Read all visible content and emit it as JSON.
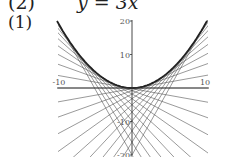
{
  "heading": {
    "number": "(2)",
    "equation": "y = 3x"
  },
  "subpart": "(1)",
  "chart_data": {
    "type": "line",
    "title": "",
    "xlabel": "",
    "ylabel": "",
    "xlim": [
      -10,
      10
    ],
    "ylim": [
      -20,
      20
    ],
    "x_ticks": [
      "-10",
      "10"
    ],
    "y_ticks": [
      "20",
      "10",
      "-10",
      "-20"
    ],
    "grid": false,
    "series": [
      {
        "name": "envelope",
        "function": "y = x^2/5",
        "x": [
          -10,
          -8,
          -6,
          -4,
          -2,
          0,
          2,
          4,
          6,
          8,
          10
        ],
        "y": [
          20,
          12.8,
          7.2,
          3.2,
          0.8,
          0,
          0.8,
          3.2,
          7.2,
          12.8,
          20
        ]
      },
      {
        "name": "tangent lines",
        "tangent_points_a": [
          -10,
          -9,
          -8,
          -7,
          -6,
          -5,
          -4,
          -3,
          -2,
          -1,
          0,
          1,
          2,
          3,
          4,
          5,
          6,
          7,
          8,
          9,
          10
        ],
        "form": "y = (2a/5)x - a^2/5"
      }
    ],
    "colors": {
      "curve": "#222222",
      "lines": "#555555",
      "axes": "#333333"
    }
  }
}
